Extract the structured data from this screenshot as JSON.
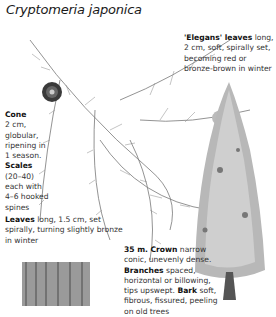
{
  "title": "Cryptomeria japonica",
  "annotations": {
    "elegans": {
      "label": "'Elegans' leaves",
      "text": "long, 2 cm, soft, spirally set, becoming red or bronze-brown in winter"
    },
    "cone": {
      "label": "Cone",
      "text": "2 cm, globular, ripening in 1 season."
    },
    "scales": {
      "label": "Scales",
      "text": "(20–40) each with 4–6 hooked spines"
    },
    "leaves": {
      "label": "Leaves",
      "text": "long, 1.5 cm, set spirally, turning slightly bronze in winter"
    },
    "tree": {
      "height_label": "35 m.",
      "crown_label": "Crown",
      "crown_text": "narrow conic, unevenly dense.",
      "branches_label": "Branches",
      "branches_text": "spaced, horizontal or billowing, tips upswept.",
      "bark_label": "Bark",
      "bark_text": "soft, fibrous, fissured, peeling on old trees"
    }
  },
  "illustrations": [
    "foliage-spray",
    "cone",
    "whole-tree",
    "bark-detail"
  ]
}
